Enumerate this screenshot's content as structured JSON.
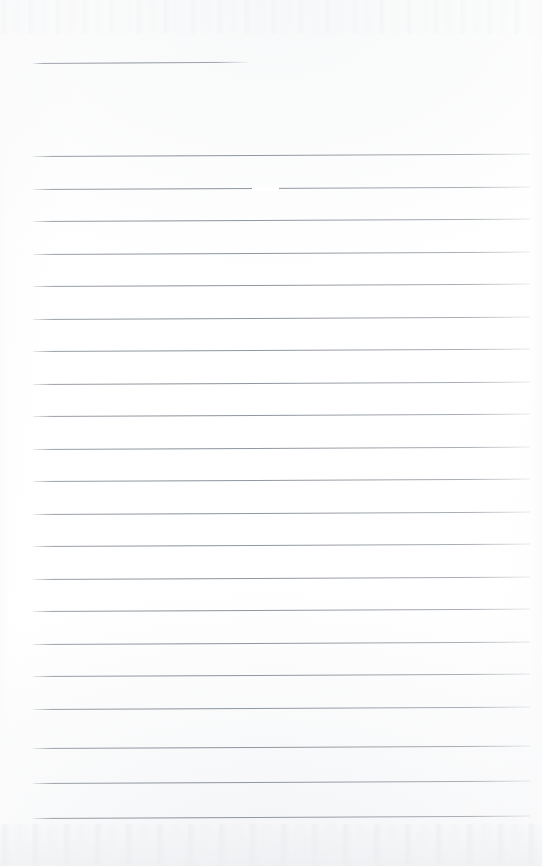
{
  "document": {
    "kind": "scanned-lined-paper",
    "title": "Blank ruled writing sheet",
    "page_width_px": 542,
    "page_height_px": 866,
    "background_color": "#ffffff",
    "rule_color": "#8b929a",
    "rule_thickness_px": 1,
    "content_text": "",
    "handwriting_present": "none",
    "notes": "Scanned blank lined notebook page; no printed or handwritten text is visible."
  },
  "layout": {
    "left_margin_px": 33,
    "right_edge_px": 530,
    "rule_spacing_px": 32.6,
    "rule_slope_deg": -0.28,
    "body_first_rule_y_px": 156,
    "body_rule_count": 21,
    "header_rule_count": 1
  },
  "rules": {
    "header": [
      {
        "id": "rule-header-1",
        "x": 33,
        "y": 63,
        "width": 215,
        "slope": -0.3
      }
    ],
    "body": [
      {
        "id": "rule-1",
        "x": 33,
        "y": 156,
        "width": 497,
        "slope": -0.28
      },
      {
        "id": "rule-2",
        "x": 33,
        "y": 189,
        "width": 497,
        "slope": -0.28,
        "gap": {
          "x": 252,
          "width": 27
        }
      },
      {
        "id": "rule-3",
        "x": 33,
        "y": 221,
        "width": 497,
        "slope": -0.28
      },
      {
        "id": "rule-4",
        "x": 33,
        "y": 254,
        "width": 497,
        "slope": -0.28
      },
      {
        "id": "rule-5",
        "x": 33,
        "y": 286,
        "width": 497,
        "slope": -0.28
      },
      {
        "id": "rule-6",
        "x": 33,
        "y": 319,
        "width": 497,
        "slope": -0.28
      },
      {
        "id": "rule-7",
        "x": 33,
        "y": 351,
        "width": 497,
        "slope": -0.28
      },
      {
        "id": "rule-8",
        "x": 33,
        "y": 384,
        "width": 497,
        "slope": -0.28
      },
      {
        "id": "rule-9",
        "x": 33,
        "y": 416,
        "width": 497,
        "slope": -0.28
      },
      {
        "id": "rule-10",
        "x": 33,
        "y": 449,
        "width": 497,
        "slope": -0.28
      },
      {
        "id": "rule-11",
        "x": 33,
        "y": 481,
        "width": 497,
        "slope": -0.28
      },
      {
        "id": "rule-12",
        "x": 33,
        "y": 514,
        "width": 497,
        "slope": -0.28
      },
      {
        "id": "rule-13",
        "x": 33,
        "y": 546,
        "width": 497,
        "slope": -0.28
      },
      {
        "id": "rule-14",
        "x": 33,
        "y": 579,
        "width": 497,
        "slope": -0.28
      },
      {
        "id": "rule-15",
        "x": 33,
        "y": 611,
        "width": 497,
        "slope": -0.28
      },
      {
        "id": "rule-16",
        "x": 33,
        "y": 644,
        "width": 497,
        "slope": -0.28
      },
      {
        "id": "rule-17",
        "x": 33,
        "y": 676,
        "width": 497,
        "slope": -0.28
      },
      {
        "id": "rule-18",
        "x": 33,
        "y": 709,
        "width": 497,
        "slope": -0.28
      },
      {
        "id": "rule-19",
        "x": 33,
        "y": 748,
        "width": 497,
        "slope": -0.28
      },
      {
        "id": "rule-20",
        "x": 33,
        "y": 783,
        "width": 497,
        "slope": -0.28
      },
      {
        "id": "rule-21",
        "x": 33,
        "y": 818,
        "width": 497,
        "slope": -0.28
      }
    ]
  }
}
